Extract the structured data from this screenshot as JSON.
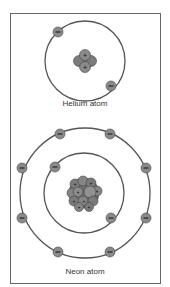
{
  "diagram": {
    "helium": {
      "label": "Helium atom",
      "electrons": 2,
      "nucleus": {
        "protons": 2,
        "neutrons": 2
      },
      "shells": 1
    },
    "neon": {
      "label": "Neon atom",
      "electrons": 10,
      "shells": 2,
      "inner_shell_electrons": 2,
      "outer_shell_electrons": 8
    },
    "symbols": {
      "electron": "−",
      "proton": "+"
    },
    "colors": {
      "border": "#555555",
      "orbit": "#555555",
      "electron_fill": "#8a8a8a",
      "nucleus_fill": "#7a7a7a"
    }
  }
}
